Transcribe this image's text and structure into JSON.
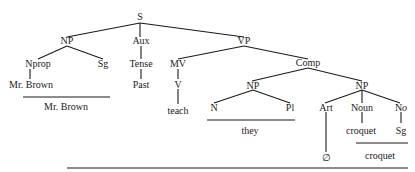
{
  "tree": {
    "root": "S",
    "nodes": {
      "S": "S",
      "NP_subj": "NP",
      "Aux": "Aux",
      "VP": "VP",
      "Nprop": "Nprop",
      "Sg1": "Sg",
      "MrBrown_leaf": "Mr. Brown",
      "Tense": "Tense",
      "Past": "Past",
      "MV": "MV",
      "V": "V",
      "teach": "teach",
      "Comp": "Comp",
      "NP_they": "NP",
      "N": "N",
      "Pl": "Pl",
      "NP_obj": "NP",
      "Art": "Art",
      "Noun": "Noun",
      "No_base": "N",
      "No_sub": "o",
      "croquet_leaf": "croquet",
      "Sg2": "Sg",
      "null": "∅"
    },
    "surface": {
      "mr_brown": "Mr. Brown",
      "they": "they",
      "croquet": "croquet"
    }
  }
}
